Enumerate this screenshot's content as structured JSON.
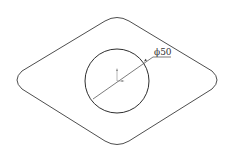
{
  "drawing": {
    "type": "cad-sketch",
    "background": "#ffffff",
    "line_color": "#3a3a3a",
    "outer_profile": {
      "shape": "rounded-rhombus",
      "left_tip": [
        14,
        80
      ],
      "right_tip": [
        220,
        80
      ],
      "top_tip": [
        117,
        17
      ],
      "bottom_tip": [
        117,
        147
      ]
    },
    "hole": {
      "shape": "circle",
      "center": [
        117,
        81
      ],
      "radius": 32
    },
    "dimension": {
      "type": "diameter",
      "label": "ϕ50",
      "value": 50
    },
    "origin_marker": {
      "axes": [
        "y-up",
        "x-right"
      ]
    }
  }
}
